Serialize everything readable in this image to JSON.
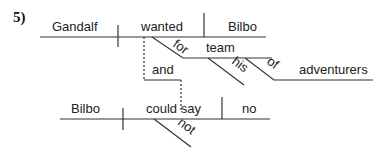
{
  "problem_number": "5)",
  "words": {
    "subject1": "Gandalf",
    "verb1": "wanted",
    "object1": "Bilbo",
    "prep1": "for",
    "prep1_object": "team",
    "modifier_his": "his",
    "prep2": "of",
    "prep2_object": "adventurers",
    "conjunction": "and",
    "subject2": "Bilbo",
    "verb2": "could say",
    "object2": "no",
    "modifier_not": "not"
  }
}
